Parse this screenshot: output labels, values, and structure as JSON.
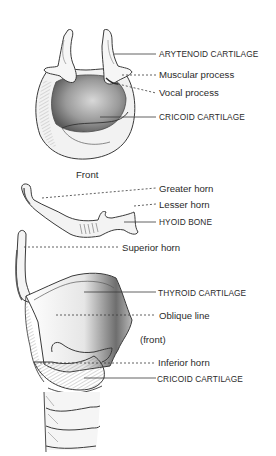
{
  "diagram": {
    "views": [
      {
        "id": "top-view",
        "caption": "Front",
        "labels": [
          {
            "text": "ARYTENOID CARTILAGE",
            "style": "caps",
            "leader": "solid"
          },
          {
            "text": "Muscular process",
            "style": "normal",
            "leader": "dashed"
          },
          {
            "text": "Vocal process",
            "style": "normal",
            "leader": "dashed"
          },
          {
            "text": "CRICOID CARTILAGE",
            "style": "caps",
            "leader": "solid"
          }
        ]
      },
      {
        "id": "hyoid-view",
        "labels": [
          {
            "text": "Greater horn",
            "style": "normal",
            "leader": "dashed"
          },
          {
            "text": "Lesser horn",
            "style": "normal",
            "leader": "dashed"
          },
          {
            "text": "HYOID BONE",
            "style": "caps",
            "leader": "solid"
          }
        ]
      },
      {
        "id": "side-view",
        "caption": "(front)",
        "labels": [
          {
            "text": "Superior horn",
            "style": "normal",
            "leader": "dashed"
          },
          {
            "text": "THYROID CARTILAGE",
            "style": "caps",
            "leader": "solid"
          },
          {
            "text": "Oblique line",
            "style": "normal",
            "leader": "dashed"
          },
          {
            "text": "Inferior horn",
            "style": "normal",
            "leader": "dashed"
          },
          {
            "text": "CRICOID CARTILAGE",
            "style": "caps",
            "leader": "solid"
          }
        ]
      }
    ],
    "colors": {
      "ink": "#2b2b2b",
      "shade": "#8a8a8a",
      "background": "#ffffff"
    }
  }
}
